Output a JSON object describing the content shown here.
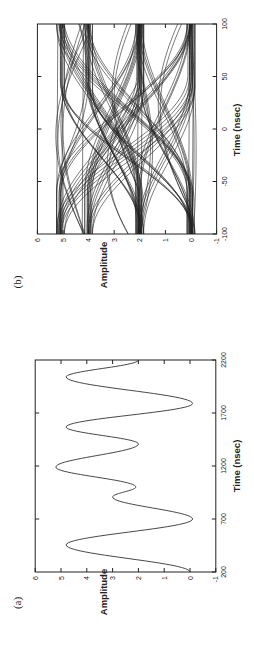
{
  "chart_data": [
    {
      "panel": "(a)",
      "type": "line",
      "title": "",
      "xlabel": "Time (nsec)",
      "ylabel": "Amplitude",
      "xlim": [
        200,
        2200
      ],
      "ylim": [
        -1,
        6
      ],
      "xticks": [
        200,
        700,
        1200,
        1700,
        2200
      ],
      "yticks": [
        -1,
        0,
        1,
        2,
        3,
        4,
        5,
        6
      ],
      "grid": false,
      "orientation": "rotated 90 degrees counter-clockwise on page",
      "series": [
        {
          "name": "signal",
          "x": [
            200,
            455,
            700,
            908,
            1002,
            1190,
            1408,
            1568,
            1790,
            2040,
            2200
          ],
          "y": [
            0.0,
            4.8,
            -0.1,
            3.0,
            2.1,
            5.2,
            2.0,
            4.8,
            -0.1,
            4.8,
            2.0
          ]
        }
      ]
    },
    {
      "panel": "(b)",
      "type": "line",
      "title": "",
      "xlabel": "Time (nsec)",
      "ylabel": "Amplitude",
      "xlim": [
        -100,
        100
      ],
      "ylim": [
        -1,
        6
      ],
      "xticks": [
        -100,
        -50,
        0,
        50,
        100
      ],
      "yticks": [
        -1,
        0,
        1,
        2,
        3,
        4,
        5,
        6
      ],
      "grid": false,
      "description": "Eye diagram: overlaid symbol-period traces transitioning between levels ~0, ~2, ~4, ~5",
      "levels": [
        0,
        2,
        4,
        5
      ],
      "crossings": [
        {
          "x": -5,
          "y": 4.0
        },
        {
          "x": 95,
          "y": 4.0
        },
        {
          "x": 40,
          "y": 2.6
        },
        {
          "x": -60,
          "y": 2.6
        },
        {
          "x": -10,
          "y": 1.0
        },
        {
          "x": 35,
          "y": 0.0
        },
        {
          "x": -75,
          "y": 0.0
        }
      ]
    }
  ],
  "labels": {
    "panel_a": "(a)",
    "panel_b": "(b)",
    "xlabel": "Time (nsec)",
    "ylabel": "Amplitude"
  }
}
